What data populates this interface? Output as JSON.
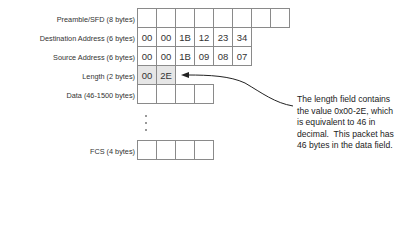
{
  "fields": [
    {
      "label": "Preamble/SFD (8 bytes)",
      "cells": [
        "",
        "",
        "",
        "",
        "",
        "",
        "",
        ""
      ]
    },
    {
      "label": "Destination Address (6 bytes)",
      "cells": [
        "00",
        "00",
        "1B",
        "12",
        "23",
        "34"
      ]
    },
    {
      "label": "Source Address (6 bytes)",
      "cells": [
        "00",
        "00",
        "1B",
        "09",
        "08",
        "07"
      ]
    },
    {
      "label": "Length (2 bytes)",
      "cells": [
        "00",
        "2E"
      ]
    },
    {
      "label": "Data (46-1500 bytes)",
      "cells": [
        "",
        "",
        "",
        ""
      ]
    },
    {
      "label": "FCS (4 bytes)",
      "cells": [
        "",
        "",
        "",
        ""
      ]
    }
  ],
  "annotation": {
    "lines": [
      "The length field contains",
      "the value 0x00-2E, which",
      "is equivalent to 46 in",
      "decimal.  This packet has",
      "46 bytes in the data field."
    ]
  },
  "colors": {
    "border": "#8a8a8a",
    "shaded": "#e6e6e6",
    "arrow": "#222222"
  }
}
